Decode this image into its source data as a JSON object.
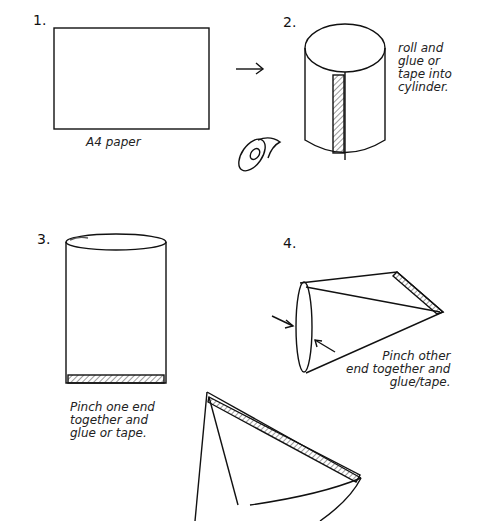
{
  "steps": [
    {
      "number": "1.",
      "caption": "A4 paper"
    },
    {
      "number": "2.",
      "caption": "roll and\nglue or\ntape into\ncylinder."
    },
    {
      "number": "3.",
      "caption": "Pinch one end\ntogether and\nglue or tape."
    },
    {
      "number": "4.",
      "caption": "Pinch other\nend together and\nglue/tape."
    }
  ],
  "icons": [
    "arrow-right-icon",
    "tape-roll-icon",
    "pinch-arrow-icon"
  ]
}
